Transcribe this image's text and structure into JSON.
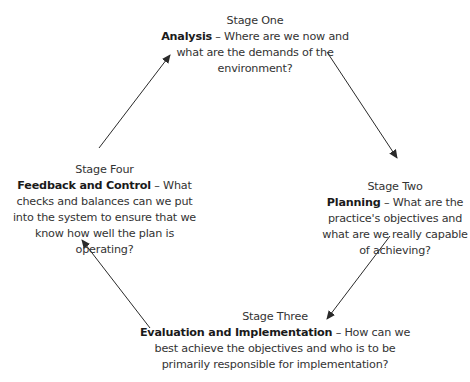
{
  "diagram": {
    "type": "cycle",
    "stages": [
      {
        "heading": "Stage One",
        "title": "Analysis",
        "separator": " – ",
        "description_line1": "Where are we now and",
        "description_rest": "what are the demands of the environment?"
      },
      {
        "heading": "Stage Two",
        "title": "Planning",
        "separator": " – ",
        "description_line1": "What are the",
        "description_rest": "practice's objectives and what are we really capable of achieving?"
      },
      {
        "heading": "Stage Three",
        "title": "Evaluation and Implementation",
        "separator": " – ",
        "description_line1": "How",
        "description_rest": "can we best achieve the objectives and who is to be primarily responsible for implementation?"
      },
      {
        "heading": "Stage Four",
        "title": "Feedback and Control",
        "separator": " – ",
        "description_line1": "What",
        "description_rest": "checks and balances can we put into the system to ensure that we know how well the plan is operating?"
      }
    ],
    "arrows": [
      {
        "from": "Stage Four",
        "to": "Stage One"
      },
      {
        "from": "Stage One",
        "to": "Stage Two"
      },
      {
        "from": "Stage Two",
        "to": "Stage Three"
      },
      {
        "from": "Stage Three",
        "to": "Stage Four"
      }
    ],
    "colors": {
      "text": "#333333",
      "arrow": "#2a2a2a",
      "background": "#ffffff"
    }
  }
}
